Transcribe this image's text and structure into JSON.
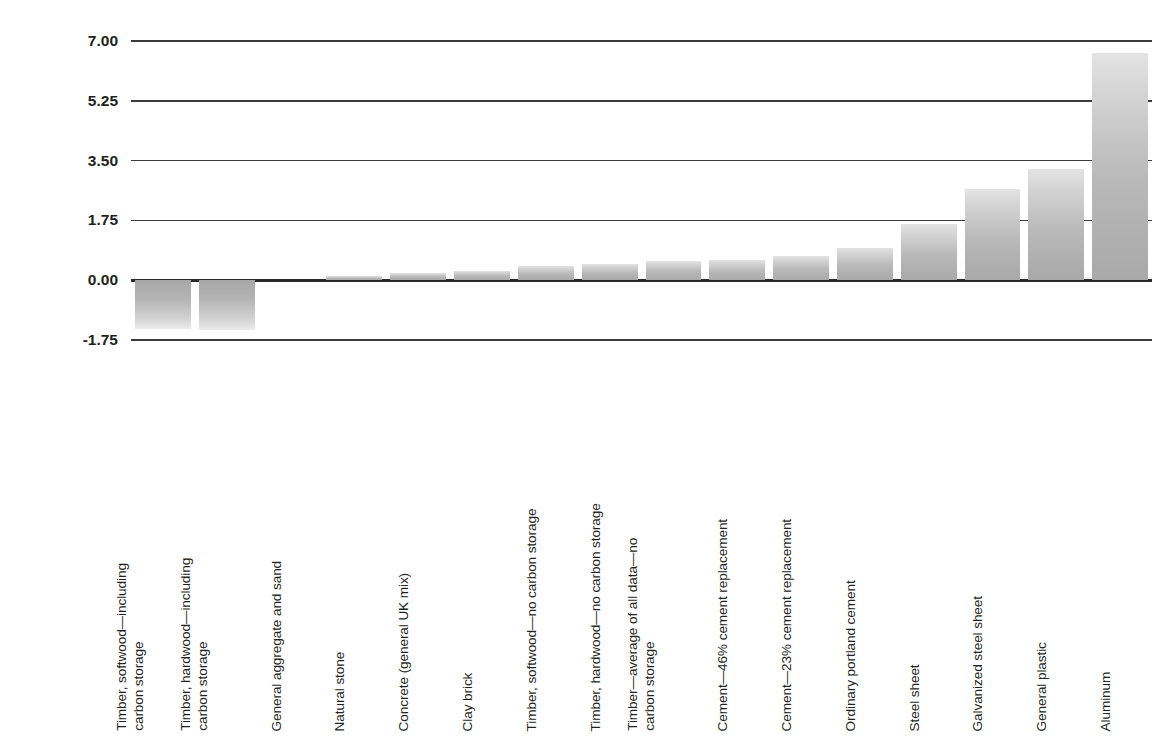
{
  "chart_data": {
    "type": "bar",
    "title": "",
    "xlabel": "",
    "ylabel": "2½lb (1kg) CO₂ emissions per 2½lb (1kg) material",
    "ylabel_parts": {
      "line1": "2½lb (1kg) CO2 emissions per",
      "line2": "2½lb (1kg) material"
    },
    "ylim": [
      -1.75,
      7.0
    ],
    "yticks": [
      7.0,
      5.25,
      3.5,
      1.75,
      0.0,
      -1.75
    ],
    "ytick_labels": [
      "7.00",
      "5.25",
      "3.50",
      "1.75",
      "0.00",
      "-1.75"
    ],
    "grid": true,
    "legend": "none",
    "bar_color": "#b9b9b9",
    "axis_color": "#3b3b3b",
    "categories": [
      "Timber, softwood—including carbon storage",
      "Timber, hardwood—including carbon storage",
      "General aggregate and sand",
      "Natural stone",
      "Concrete (general UK mix)",
      "Clay brick",
      "Timber, softwood—no carbon storage",
      "Timber, hardwood—no carbon storage",
      "Timber—average of all data—no carbon storage",
      "Cement—46% cement replacement",
      "Cement—23% cement replacement",
      "Ordinary portland cement",
      "Steel sheet",
      "Galvanized steel sheet",
      "General plastic",
      "Aluminum"
    ],
    "category_lines": [
      [
        "Timber, softwood—including",
        "carbon storage"
      ],
      [
        "Timber, hardwood—including",
        "carbon storage"
      ],
      [
        "General aggregate and sand"
      ],
      [
        "Natural stone"
      ],
      [
        "Concrete (general UK mix)"
      ],
      [
        "Clay brick"
      ],
      [
        "Timber, softwood—no carbon storage"
      ],
      [
        "Timber, hardwood—no carbon storage"
      ],
      [
        "Timber—average of all data—no",
        "carbon storage"
      ],
      [
        "Cement—46% cement replacement"
      ],
      [
        "Cement—23% cement replacement"
      ],
      [
        "Ordinary portland cement"
      ],
      [
        "Steel sheet"
      ],
      [
        "Galvanized steel sheet"
      ],
      [
        "General plastic"
      ],
      [
        "Aluminum"
      ]
    ],
    "values": [
      -1.42,
      -1.45,
      0.0,
      0.12,
      0.21,
      0.26,
      0.41,
      0.46,
      0.56,
      0.58,
      0.7,
      0.93,
      1.65,
      2.68,
      3.25,
      6.65
    ]
  }
}
